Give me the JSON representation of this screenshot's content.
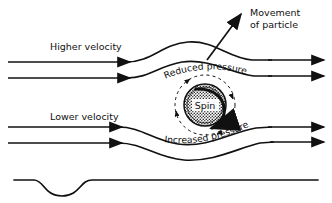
{
  "figure": {
    "background": "#ffffff",
    "ink": "#111111",
    "width": 332,
    "height": 203
  },
  "labels": {
    "higher_velocity": "Higher velocity",
    "lower_velocity": "Lower velocity",
    "movement_line1": "Movement",
    "movement_line2": "of particle",
    "reduced_pressure": "Reduced  pressure",
    "increased_pressure": "Increased  pressure",
    "spin": "Spin"
  },
  "diagram_data": {
    "type": "schematic",
    "streamlines": [
      {
        "name": "upper-outer",
        "y_left": 62,
        "y_right": 62,
        "deflection": "up-over-particle"
      },
      {
        "name": "upper-inner",
        "y_left": 78,
        "y_right": 70,
        "deflection": "up-over-particle"
      },
      {
        "name": "lower-inner",
        "y_left": 127,
        "y_right": 118,
        "deflection": "down-under-particle"
      },
      {
        "name": "lower-outer",
        "y_left": 143,
        "y_right": 133,
        "deflection": "down-under-particle"
      }
    ],
    "particle": {
      "cx": 205,
      "cy": 105,
      "r": 21,
      "fill": "stipple",
      "spin_direction": "clockwise"
    },
    "circulation_ring": {
      "cx": 205,
      "cy": 105,
      "r": 30,
      "style": "dashed",
      "arrowheads": 4
    },
    "movement_arrow": {
      "from": [
        208,
        60
      ],
      "to": [
        243,
        12
      ],
      "direction": "up-right"
    },
    "wall": {
      "y": 180,
      "feature": "single downward dip",
      "dip_center_x": 62,
      "dip_depth": 14
    }
  }
}
